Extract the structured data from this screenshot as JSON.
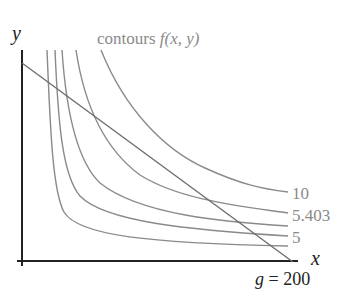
{
  "diagram": {
    "title": "contours f(x, y)",
    "title_parts": {
      "word": "contours",
      "func": "f(x, y)"
    },
    "axes": {
      "x_label": "x",
      "y_label": "y"
    },
    "constraint_label": "g = 200",
    "contour_labels": [
      "10",
      "5.403",
      "5"
    ],
    "contour_count": 5,
    "colors": {
      "axes": "#222222",
      "contours": "#8a8a8a",
      "constraint": "#6e6e6e",
      "labels": "#8a8a8a"
    }
  }
}
